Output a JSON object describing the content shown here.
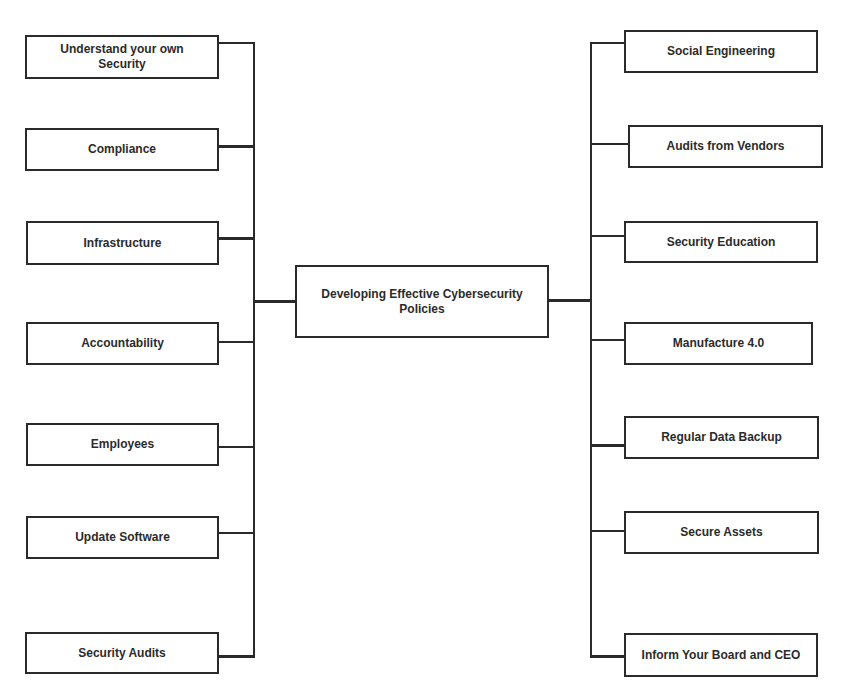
{
  "diagram": {
    "title": "Developing Effective Cybersecurity Policies",
    "center": {
      "line1": "Developing Effective Cybersecurity",
      "line2": "Policies"
    },
    "left_items": [
      {
        "line1": "Understand your own",
        "line2": "Security"
      },
      {
        "label": "Compliance"
      },
      {
        "label": "Infrastructure"
      },
      {
        "label": "Accountability"
      },
      {
        "label": "Employees"
      },
      {
        "label": "Update Software"
      },
      {
        "label": "Security Audits"
      }
    ],
    "right_items": [
      {
        "label": "Social Engineering"
      },
      {
        "label": "Audits from Vendors"
      },
      {
        "label": "Security Education"
      },
      {
        "label": "Manufacture 4.0"
      },
      {
        "label": "Regular Data Backup"
      },
      {
        "label": "Secure Assets"
      },
      {
        "label": "Inform Your Board and CEO"
      }
    ],
    "colors": {
      "line": "#2a2a2a",
      "text": "#2b2b2b",
      "background": "#ffffff"
    }
  }
}
